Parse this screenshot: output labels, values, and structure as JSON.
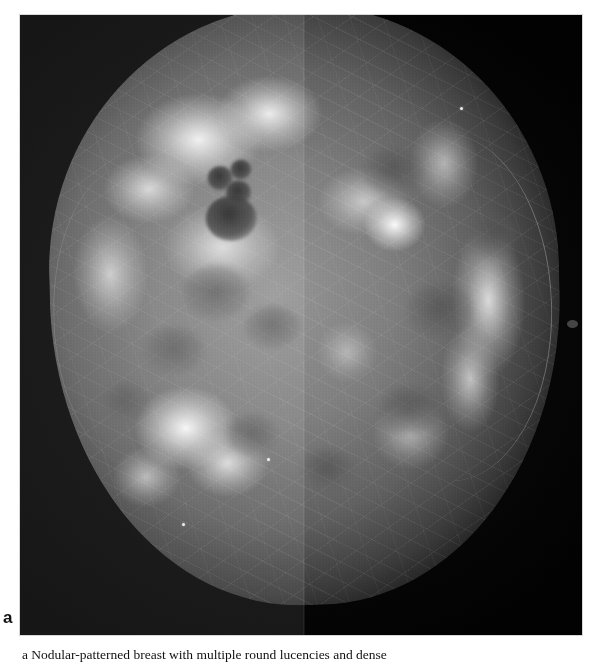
{
  "figure": {
    "label": "a",
    "caption_visible_fragment": "a Nodular-patterned breast with multiple round lucencies and dense",
    "modality": "mammogram",
    "view": "craniocaudal",
    "composite": "two vertically split halves, left half brighter than right half",
    "seam_x_px": 303
  },
  "colors": {
    "page_background": "#ffffff",
    "film_background": "#050505",
    "tissue_mid_gray": "#7e7e7e",
    "tissue_bright": "#f8f8f8",
    "cyst_dark": "#1c1c1c",
    "label_text": "#111111"
  },
  "image_frame": {
    "left": 20,
    "top": 15,
    "width": 562,
    "height": 620
  },
  "findings": {
    "cysts": [
      {
        "name": "upper-left small cyst cluster",
        "cx": 200,
        "cy": 185,
        "rx": 13,
        "ry": 11
      },
      {
        "name": "upper-left small cyst",
        "cx": 218,
        "cy": 178,
        "rx": 10,
        "ry": 9
      },
      {
        "name": "upper-left large round cyst",
        "cx": 212,
        "cy": 223,
        "rx": 26,
        "ry": 22
      }
    ],
    "lucencies": [
      {
        "name": "mid-left lucency",
        "cx": 190,
        "cy": 300,
        "rx": 30,
        "ry": 24
      },
      {
        "name": "mid-left lower lucency",
        "cx": 158,
        "cy": 355,
        "rx": 27,
        "ry": 21
      },
      {
        "name": "central lucency",
        "cx": 240,
        "cy": 340,
        "rx": 24,
        "ry": 19
      },
      {
        "name": "lower-left lucency",
        "cx": 235,
        "cy": 445,
        "rx": 22,
        "ry": 17
      },
      {
        "name": "right upper lucency",
        "cx": 395,
        "cy": 185,
        "rx": 26,
        "ry": 20
      },
      {
        "name": "right mid lucency",
        "cx": 430,
        "cy": 320,
        "rx": 28,
        "ry": 22
      },
      {
        "name": "right lower lucency",
        "cx": 400,
        "cy": 420,
        "rx": 26,
        "ry": 20
      }
    ],
    "dense_masses": [
      {
        "name": "left upper dense band",
        "cx": 195,
        "cy": 150
      },
      {
        "name": "left lower dense mass",
        "cx": 185,
        "cy": 430
      },
      {
        "name": "right focal dense mass",
        "cx": 450,
        "cy": 240
      },
      {
        "name": "right lateral dense band",
        "cx": 515,
        "cy": 320
      }
    ],
    "calcification_specks": [
      {
        "cx": 180,
        "cy": 520
      },
      {
        "cx": 265,
        "cy": 455
      },
      {
        "cx": 460,
        "cy": 105
      }
    ]
  }
}
